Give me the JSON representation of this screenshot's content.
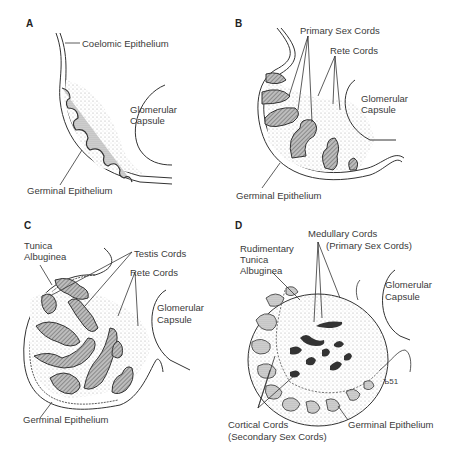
{
  "figure": {
    "panels": [
      {
        "id": "A",
        "labels": {
          "coelomic": "Coelomic Epithelium",
          "glom1": "Glomerular",
          "glom2": "Capsule",
          "germinal": "Germinal Epithelium"
        }
      },
      {
        "id": "B",
        "labels": {
          "primary": "Primary Sex Cords",
          "rete": "Rete Cords",
          "glom1": "Glomerular",
          "glom2": "Capsule",
          "germinal": "Germinal Epithelium"
        }
      },
      {
        "id": "C",
        "labels": {
          "tunica1": "Tunica",
          "tunica2": "Albuginea",
          "testis": "Testis Cords",
          "rete": "Rete Cords",
          "glom1": "Glomerular",
          "glom2": "Capsule",
          "germinal": "Germinal Epithelium"
        }
      },
      {
        "id": "D",
        "labels": {
          "medullary1": "Medullary Cords",
          "medullary2": "(Primary Sex Cords)",
          "rud1": "Rudimentary",
          "rud2": "Tunica",
          "rud3": "Albuginea",
          "glom1": "Glomerular",
          "glom2": "Capsule",
          "cortical1": "Cortical Cords",
          "cortical2": "(Secondary Sex Cords)",
          "germinal": "Germinal Epithelium",
          "signature": "Ъ51"
        }
      }
    ]
  }
}
